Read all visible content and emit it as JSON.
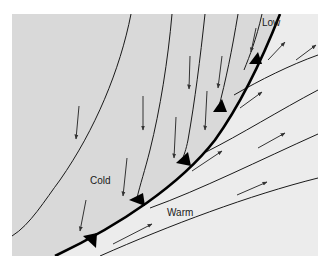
{
  "diagram": {
    "type": "cold-front-schematic",
    "labels": {
      "low": "Low",
      "cold": "Cold",
      "warm": "Warm"
    },
    "colors": {
      "background": "#ffffff",
      "cold_air": "#d9d9d9",
      "warm_air": "#ececec",
      "front_line": "#000000",
      "isobar": "#1a1a1a",
      "arrow": "#333333"
    },
    "front": {
      "kind": "cold-front",
      "triangle_count": 5,
      "triangle_side": "warm"
    },
    "cold_sector": {
      "isobar_count": 5,
      "wind_arrow_count": 9,
      "wind_direction": "southward (down)"
    },
    "warm_sector": {
      "isobar_count": 4,
      "wind_arrow_count": 7,
      "wind_direction": "northeastward (up-right)"
    }
  }
}
